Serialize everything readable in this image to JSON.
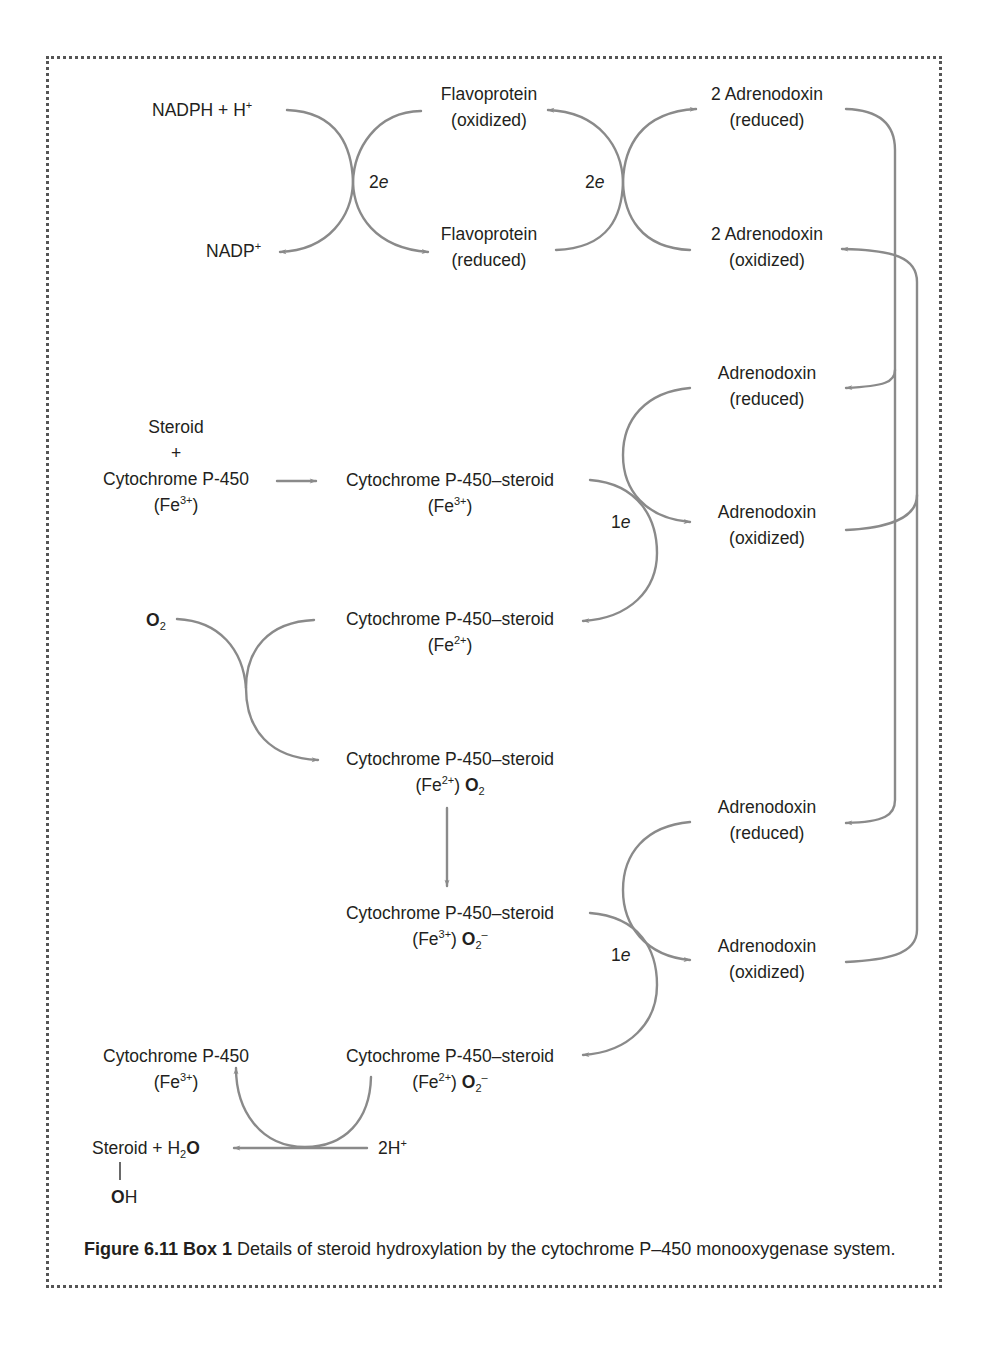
{
  "diagram": {
    "colors": {
      "arrow": "#8a8a8a",
      "text": "#231f20",
      "border": "#555555"
    },
    "top": {
      "nadph": "NADPH + H",
      "nadph_sup": "+",
      "nadp": "NADP",
      "nadp_sup": "+",
      "flavo_ox_1": "Flavoprotein",
      "flavo_ox_2": "(oxidized)",
      "flavo_red_1": "Flavoprotein",
      "flavo_red_2": "(reduced)",
      "adx2_red_1": "2 Adrenodoxin",
      "adx2_red_2": "(reduced)",
      "adx2_ox_1": "2 Adrenodoxin",
      "adx2_ox_2": "(oxidized)",
      "e_left_num": "2",
      "e_left_sym": "e",
      "e_right_num": "2",
      "e_right_sym": "e"
    },
    "step1": {
      "steroid": "Steroid",
      "plus": "+",
      "cyp": "Cytochrome P-450",
      "cyp_fe": "(Fe",
      "cyp_fe_sup": "3+",
      "cyp_fe_close": ")",
      "complex": "Cytochrome P-450–steroid",
      "complex_fe": "(Fe",
      "complex_fe_sup": "3+",
      "complex_fe_close": ")",
      "adx_red_1": "Adrenodoxin",
      "adx_red_2": "(reduced)",
      "adx_ox_1": "Adrenodoxin",
      "adx_ox_2": "(oxidized)",
      "e_num": "1",
      "e_sym": "e"
    },
    "step2": {
      "o2": "O",
      "o2_sub": "2",
      "complex": "Cytochrome P-450–steroid",
      "complex_fe": "(Fe",
      "complex_fe_sup": "2+",
      "complex_fe_close": ")"
    },
    "step3": {
      "complex": "Cytochrome P-450–steroid",
      "complex_fe": "(Fe",
      "complex_fe_sup": "2+",
      "complex_fe_close": ")",
      "o2": "O",
      "o2_sub": "2"
    },
    "step4": {
      "complex": "Cytochrome P-450–steroid",
      "complex_fe": "(Fe",
      "complex_fe_sup": "3+",
      "complex_fe_close": ")",
      "o2": "O",
      "o2_sub": "2",
      "o2_sup": "–",
      "adx_red_1": "Adrenodoxin",
      "adx_red_2": "(reduced)",
      "adx_ox_1": "Adrenodoxin",
      "adx_ox_2": "(oxidized)",
      "e_num": "1",
      "e_sym": "e"
    },
    "step5": {
      "complex": "Cytochrome P-450–steroid",
      "complex_fe": "(Fe",
      "complex_fe_sup": "2+",
      "complex_fe_close": ")",
      "o2": "O",
      "o2_sub": "2",
      "o2_sup": "–",
      "cyp": "Cytochrome P-450",
      "cyp_fe": "(Fe",
      "cyp_fe_sup": "3+",
      "cyp_fe_close": ")",
      "product": "Steroid + H",
      "product_sub": "2",
      "product_o": "O",
      "oh_o": "O",
      "oh_h": "H",
      "protons": "2H",
      "protons_sup": "+"
    }
  },
  "caption": {
    "label": "Figure 6.11 Box 1",
    "text": " Details of steroid hydroxylation by the cytochrome P–450 monooxygenase system."
  }
}
